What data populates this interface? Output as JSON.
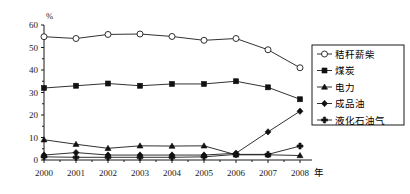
{
  "chart_data": {
    "type": "line",
    "title": "",
    "xlabel": "年",
    "ylabel": "%",
    "x": [
      "2000",
      "2001",
      "2002",
      "2003",
      "2004",
      "2005",
      "2006",
      "2007",
      "2008"
    ],
    "xlim": [
      2000,
      2008
    ],
    "ylim": [
      0,
      60
    ],
    "yticks": [
      "0",
      "10",
      "20",
      "30",
      "40",
      "50",
      "60"
    ],
    "grid": false,
    "legend_position": "right",
    "series": [
      {
        "name": "秸秆薪柴",
        "marker": "open-circle",
        "values": [
          54.8,
          54.0,
          55.8,
          56.0,
          54.9,
          53.2,
          54.0,
          49.0,
          41.0
        ]
      },
      {
        "name": "煤炭",
        "marker": "filled-square",
        "values": [
          32.0,
          33.0,
          34.0,
          33.0,
          33.8,
          33.8,
          35.0,
          32.3,
          27.0
        ]
      },
      {
        "name": "电力",
        "marker": "filled-triangle",
        "values": [
          9.0,
          7.0,
          5.2,
          6.3,
          6.2,
          6.3,
          2.3,
          2.3,
          2.0
        ]
      },
      {
        "name": "成品油",
        "marker": "filled-diamond",
        "values": [
          2.2,
          3.3,
          2.2,
          2.2,
          2.2,
          2.2,
          3.0,
          12.5,
          21.7
        ]
      },
      {
        "name": "液化石油气",
        "marker": "filled-cross",
        "values": [
          1.4,
          1.2,
          1.2,
          1.2,
          1.2,
          1.4,
          2.5,
          2.5,
          6.2
        ]
      }
    ]
  },
  "colors": {
    "ink": "#1a1a1a",
    "background": "#ffffff",
    "marker_fill": "#111111",
    "marker_open": "#ffffff"
  }
}
